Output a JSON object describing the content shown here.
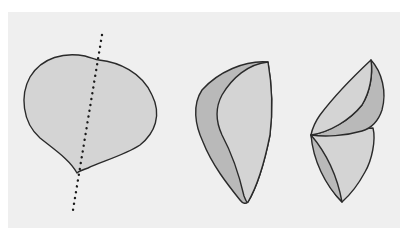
{
  "diagram": {
    "colors": {
      "background": "#ffffff",
      "panel": "#efefef",
      "fill_light": "#d4d4d4",
      "fill_dark": "#b9b9b9",
      "outline": "#2a2a2a",
      "axis_dots": "#1a1a1a"
    },
    "figures": [
      {
        "id": "flat-leaf",
        "label": "",
        "has_fold_axis": true
      },
      {
        "id": "half-folded-leaf",
        "label": ""
      },
      {
        "id": "fully-folded-leaf",
        "label": ""
      }
    ]
  }
}
